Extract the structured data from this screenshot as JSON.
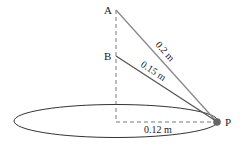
{
  "diagram": {
    "points": {
      "A": {
        "label": "A",
        "x": 116,
        "y": 10
      },
      "B": {
        "label": "B",
        "x": 116,
        "y": 56
      },
      "P": {
        "label": "P",
        "x": 217,
        "y": 122
      },
      "O": {
        "x": 116,
        "y": 122
      }
    },
    "segments": [
      {
        "from": "A",
        "to": "P",
        "label": "0.2 m"
      },
      {
        "from": "B",
        "to": "P",
        "label": "0.15 m"
      },
      {
        "from": "O",
        "to": "P",
        "label": "0.12 m",
        "style": "dashed"
      }
    ],
    "axis_label": "",
    "ellipse": {
      "cx": 116,
      "cy": 121,
      "rx": 102,
      "ry": 17
    }
  }
}
